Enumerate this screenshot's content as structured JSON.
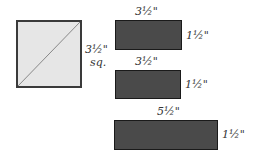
{
  "diagram": {
    "square": {
      "size_label": "3½\"",
      "sq_label": "sq.",
      "fill": "#e6e6e6",
      "has_diagonal": true
    },
    "rectangles": [
      {
        "width_label": "3½\"",
        "height_label": "1½\"",
        "fill": "#4a4a4a"
      },
      {
        "width_label": "3½\"",
        "height_label": "1½\"",
        "fill": "#4a4a4a"
      },
      {
        "width_label": "5½\"",
        "height_label": "1½\"",
        "fill": "#4a4a4a"
      }
    ]
  }
}
